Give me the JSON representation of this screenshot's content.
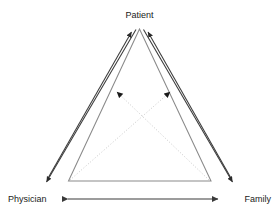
{
  "diagram": {
    "type": "triangle-relationship-diagram",
    "nodes": [
      {
        "id": "patient",
        "label": "Patient",
        "position": "top"
      },
      {
        "id": "physician",
        "label": "Physician",
        "position": "bottom-left"
      },
      {
        "id": "family",
        "label": "Family",
        "position": "bottom-right"
      }
    ],
    "edges": [
      {
        "id": "physician-to-patient",
        "from": "physician",
        "to": "patient",
        "style": "solid",
        "arrows": "single"
      },
      {
        "id": "family-to-patient",
        "from": "family",
        "to": "patient",
        "style": "solid",
        "arrows": "single"
      },
      {
        "id": "patient-to-physician",
        "from": "patient",
        "to": "physician",
        "style": "solid",
        "arrows": "single"
      },
      {
        "id": "patient-to-family",
        "from": "patient",
        "to": "family",
        "style": "solid",
        "arrows": "single"
      },
      {
        "id": "physician-to-family-diagonal",
        "from": "physician",
        "to": "family-side",
        "style": "dotted",
        "arrows": "single"
      },
      {
        "id": "family-to-physician-diagonal",
        "from": "family",
        "to": "physician-side",
        "style": "dotted",
        "arrows": "single"
      },
      {
        "id": "physician-family",
        "from": "physician",
        "to": "family",
        "style": "solid",
        "arrows": "double"
      }
    ],
    "colors": {
      "stroke": "#3a3a3a",
      "dotted_stroke": "#bdbdbd",
      "inner_triangle": "#8a8a8a",
      "text": "#1a1a1a",
      "background": "#ffffff"
    }
  }
}
